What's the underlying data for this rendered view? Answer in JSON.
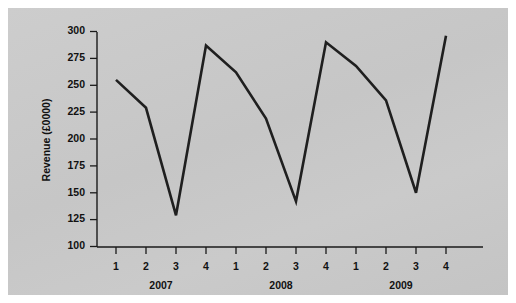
{
  "chart_data": {
    "type": "line",
    "title": "",
    "subtitle": "",
    "xlabel": "",
    "ylabel": "Revenue (£0000)",
    "ylim": [
      100,
      300
    ],
    "ytick_labels": [
      "100",
      "125",
      "150",
      "175",
      "200",
      "225",
      "250",
      "275",
      "300"
    ],
    "ytick_values": [
      100,
      125,
      150,
      175,
      200,
      225,
      250,
      275,
      300
    ],
    "grid": false,
    "legend": null,
    "legend_position": "none",
    "x": [
      "1",
      "2",
      "3",
      "4",
      "1",
      "2",
      "3",
      "4",
      "1",
      "2",
      "3",
      "4"
    ],
    "xtick_labels": [
      "1",
      "2",
      "3",
      "4",
      "1",
      "2",
      "3",
      "4",
      "1",
      "2",
      "3",
      "4"
    ],
    "group_labels": [
      "2007",
      "2008",
      "2009"
    ],
    "groups": [
      {
        "label": "2007",
        "quarters": [
          "1",
          "2",
          "3",
          "4"
        ]
      },
      {
        "label": "2008",
        "quarters": [
          "1",
          "2",
          "3",
          "4"
        ]
      },
      {
        "label": "2009",
        "quarters": [
          "1",
          "2",
          "3",
          "4"
        ]
      }
    ],
    "values": [
      255,
      229,
      129,
      287,
      262,
      219,
      142,
      290,
      268,
      236,
      150,
      296
    ],
    "series": [
      {
        "name": "Revenue",
        "values": [
          255,
          229,
          129,
          287,
          262,
          219,
          142,
          290,
          268,
          236,
          150,
          296
        ],
        "points": [
          {
            "year": "2007",
            "quarter": "1",
            "value": 255
          },
          {
            "year": "2007",
            "quarter": "2",
            "value": 229
          },
          {
            "year": "2007",
            "quarter": "3",
            "value": 129
          },
          {
            "year": "2007",
            "quarter": "4",
            "value": 287
          },
          {
            "year": "2008",
            "quarter": "1",
            "value": 262
          },
          {
            "year": "2008",
            "quarter": "2",
            "value": 219
          },
          {
            "year": "2008",
            "quarter": "3",
            "value": 142
          },
          {
            "year": "2008",
            "quarter": "4",
            "value": 290
          },
          {
            "year": "2009",
            "quarter": "1",
            "value": 268
          },
          {
            "year": "2009",
            "quarter": "2",
            "value": 236
          },
          {
            "year": "2009",
            "quarter": "3",
            "value": 150
          },
          {
            "year": "2009",
            "quarter": "4",
            "value": 296
          }
        ]
      }
    ],
    "colors": {
      "line": "#1f1f1f",
      "axis": "#1a1a1a",
      "text": "#111111",
      "plot_background": "#c9c9c9",
      "page_background": "#ffffff"
    }
  }
}
